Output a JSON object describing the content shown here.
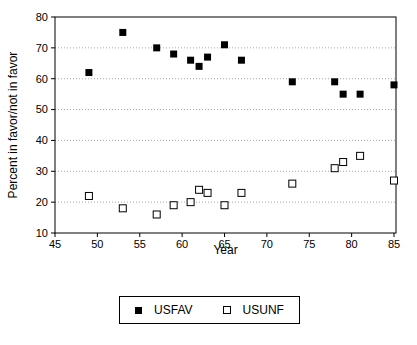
{
  "chart_data": {
    "type": "scatter",
    "title": "",
    "xlabel": "Year",
    "ylabel": "Percent in favor/not in favor",
    "xlim": [
      45,
      85
    ],
    "ylim": [
      10,
      80
    ],
    "x_ticks": [
      45,
      50,
      55,
      60,
      65,
      70,
      75,
      80,
      85
    ],
    "y_ticks": [
      10,
      20,
      30,
      40,
      50,
      60,
      70,
      80
    ],
    "grid": "horizontal-dotted",
    "legend_position": "bottom-center",
    "series": [
      {
        "name": "USFAV",
        "marker": "filled-square",
        "color": "#000000",
        "points": [
          [
            49,
            62
          ],
          [
            53,
            75
          ],
          [
            57,
            70
          ],
          [
            59,
            68
          ],
          [
            61,
            66
          ],
          [
            62,
            64
          ],
          [
            63,
            67
          ],
          [
            65,
            71
          ],
          [
            67,
            66
          ],
          [
            73,
            59
          ],
          [
            78,
            59
          ],
          [
            79,
            55
          ],
          [
            81,
            55
          ],
          [
            85,
            58
          ]
        ]
      },
      {
        "name": "USUNF",
        "marker": "open-square",
        "color": "#000000",
        "points": [
          [
            49,
            22
          ],
          [
            53,
            18
          ],
          [
            57,
            16
          ],
          [
            59,
            19
          ],
          [
            61,
            20
          ],
          [
            62,
            24
          ],
          [
            63,
            23
          ],
          [
            65,
            19
          ],
          [
            67,
            23
          ],
          [
            73,
            26
          ],
          [
            78,
            31
          ],
          [
            79,
            33
          ],
          [
            81,
            35
          ],
          [
            85,
            27
          ]
        ]
      }
    ]
  },
  "colors": {
    "background": "#ffffff",
    "axis": "#000000",
    "gridline": "#a8a8a8",
    "marker_fill": "#000000",
    "marker_open_fill": "#ffffff"
  }
}
